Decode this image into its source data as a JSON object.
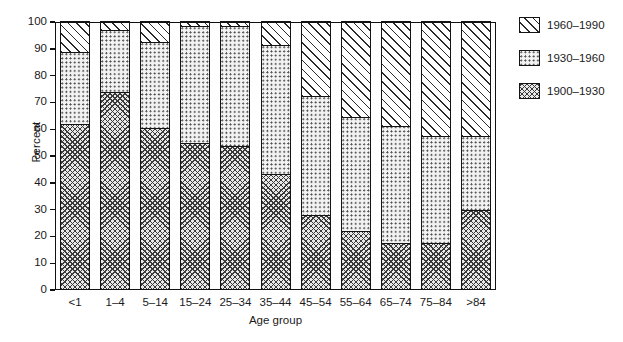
{
  "chart_data": {
    "type": "bar",
    "subtype": "stacked-bar-100-percent",
    "title": "",
    "xlabel": "Age group",
    "ylabel": "Percent",
    "ylim": [
      0,
      100
    ],
    "yticks": [
      0,
      10,
      20,
      30,
      40,
      50,
      60,
      70,
      80,
      90,
      100
    ],
    "ytick_labels": [
      "0",
      "10",
      "20",
      "30",
      "40",
      "50",
      "60",
      "70",
      "80",
      "90",
      "100"
    ],
    "grid": false,
    "legend_position": "right",
    "categories": [
      "<1",
      "1–4",
      "5–14",
      "15–24",
      "25–34",
      "35–44",
      "45–54",
      "55–64",
      "65–74",
      "75–84",
      ">84"
    ],
    "series": [
      {
        "name": "1900–1930",
        "pattern": "cross-hatch",
        "stack_order": 0,
        "values": [
          61.5,
          73.5,
          60.0,
          54.5,
          53.5,
          43.0,
          27.5,
          21.5,
          17.0,
          17.0,
          29.5
        ]
      },
      {
        "name": "1930–1960",
        "pattern": "fine-dots",
        "stack_order": 1,
        "values": [
          27.0,
          23.0,
          32.0,
          43.5,
          44.5,
          48.0,
          44.5,
          42.5,
          44.0,
          40.0,
          27.5
        ]
      },
      {
        "name": "1960–1990",
        "pattern": "diagonal-hatch",
        "stack_order": 2,
        "values": [
          11.5,
          3.5,
          8.0,
          2.0,
          2.0,
          9.0,
          28.0,
          36.0,
          39.0,
          43.0,
          43.0
        ]
      }
    ],
    "cumulative_tops": {
      "1900–1930": [
        61.5,
        73.5,
        60.0,
        54.5,
        53.5,
        43.0,
        27.5,
        21.5,
        17.0,
        17.0,
        29.5
      ],
      "1930–1960": [
        88.5,
        96.5,
        92.0,
        98.0,
        98.0,
        91.0,
        72.0,
        64.0,
        61.0,
        57.0,
        57.0
      ],
      "1960–1990": [
        100,
        100,
        100,
        100,
        100,
        100,
        100,
        100,
        100,
        100,
        100
      ]
    }
  },
  "legend": {
    "items": [
      {
        "label": "1960–1990",
        "pattern": "diagonal-hatch"
      },
      {
        "label": "1930–1960",
        "pattern": "fine-dots"
      },
      {
        "label": "1900–1930",
        "pattern": "cross-hatch"
      }
    ]
  },
  "colors": {
    "axis": "#111111",
    "ink": "#1a1a1a",
    "background": "#ffffff",
    "hatch": "#2a2a2a",
    "dots": "#4a4a4a",
    "cross": "#3a3a3a"
  }
}
